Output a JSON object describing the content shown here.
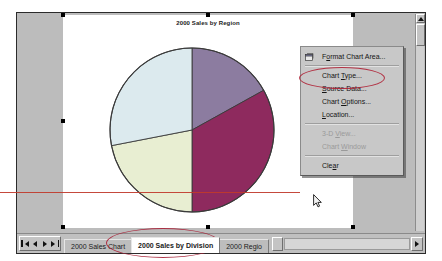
{
  "application": {
    "name": "Microsoft Excel",
    "document_type": "chart-sheet"
  },
  "chart": {
    "title": "2000 Sales by Region",
    "selected": true
  },
  "chart_data": {
    "type": "pie",
    "title": "2000 Sales by Region",
    "xlabel": "",
    "ylabel": "",
    "categories": [
      "Region 1",
      "Region 2",
      "Region 3",
      "Region 4"
    ],
    "values": [
      17,
      33,
      22,
      28
    ],
    "slices": [
      {
        "label": "Region 1",
        "value": 17,
        "percent": 17,
        "color": "#8c7ca0",
        "start_angle": 0,
        "end_angle": 61
      },
      {
        "label": "Region 2",
        "value": 33,
        "percent": 33,
        "color": "#8e2a5e",
        "start_angle": 61,
        "end_angle": 180
      },
      {
        "label": "Region 3",
        "value": 22,
        "percent": 22,
        "color": "#e8eed2",
        "start_angle": 180,
        "end_angle": 259
      },
      {
        "label": "Region 4",
        "value": 28,
        "percent": 28,
        "color": "#dceaee",
        "start_angle": 259,
        "end_angle": 360
      }
    ],
    "legend": false,
    "grid": false,
    "data_labels": false,
    "border_color": "#3a3a3a"
  },
  "context_menu": {
    "items": [
      {
        "label": "Format Chart Area...",
        "enabled": true,
        "icon": "format-chart-area-icon",
        "accel": "o",
        "separator_after": true
      },
      {
        "label": "Chart Type...",
        "enabled": true,
        "icon": "",
        "accel": "T",
        "separator_after": false
      },
      {
        "label": "Source Data...",
        "enabled": true,
        "icon": "",
        "accel": "S",
        "separator_after": false
      },
      {
        "label": "Chart Options...",
        "enabled": true,
        "icon": "",
        "accel": "O",
        "separator_after": false
      },
      {
        "label": "Location...",
        "enabled": true,
        "icon": "",
        "accel": "L",
        "separator_after": true
      },
      {
        "label": "3-D View...",
        "enabled": false,
        "icon": "",
        "accel": "V",
        "separator_after": false
      },
      {
        "label": "Chart Window",
        "enabled": false,
        "icon": "",
        "accel": "W",
        "separator_after": true
      },
      {
        "label": "Clear",
        "enabled": true,
        "icon": "",
        "accel": "a",
        "separator_after": false
      }
    ]
  },
  "sheet_tabs": {
    "nav_buttons": [
      "first-sheet",
      "previous-sheet",
      "next-sheet",
      "last-sheet"
    ],
    "tabs": [
      {
        "label": "2000 Sales Chart",
        "active": false
      },
      {
        "label": "2000 Sales by Division",
        "active": true
      },
      {
        "label": "2000 Regio",
        "active": false
      }
    ]
  },
  "annotations": {
    "highlight_color": "#b0263a",
    "items": [
      {
        "name": "pointer-line",
        "shape": "line"
      },
      {
        "name": "chart-type-circle",
        "shape": "ellipse"
      },
      {
        "name": "active-tab-circle",
        "shape": "ellipse"
      }
    ]
  },
  "scrollbars": {
    "vertical_visible": true,
    "horizontal_visible": true
  }
}
